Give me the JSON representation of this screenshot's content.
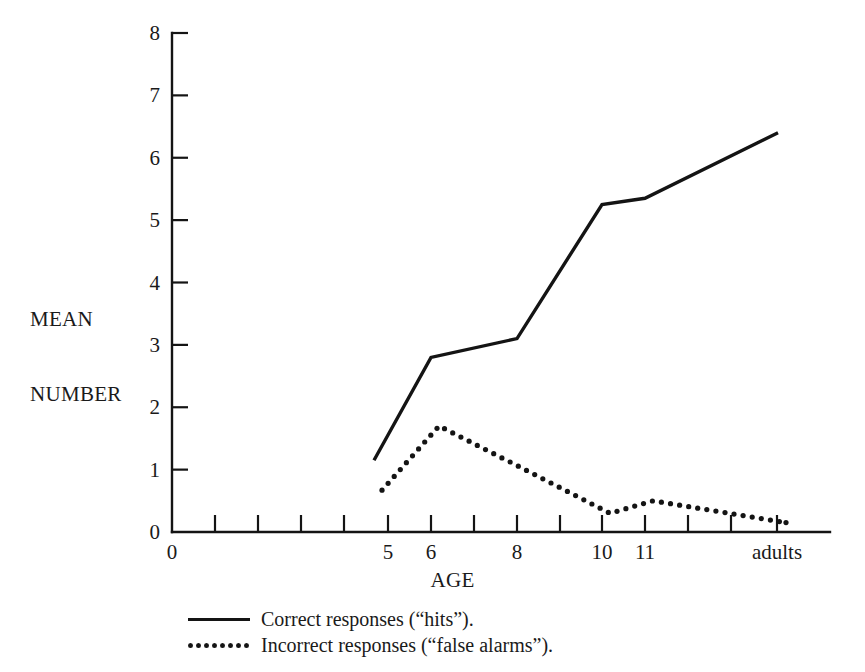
{
  "chart_data": {
    "type": "line",
    "title": "",
    "xlabel": "AGE",
    "ylabel": "MEAN\nNUMBER",
    "ylabel_lines": [
      "MEAN",
      "NUMBER"
    ],
    "ylim": [
      0,
      8
    ],
    "ytick_values": [
      0,
      1,
      2,
      3,
      4,
      5,
      6,
      7,
      8
    ],
    "ytick_labels": [
      "0",
      "1",
      "2",
      "3",
      "4",
      "5",
      "6",
      "7",
      "8"
    ],
    "grid": false,
    "legend_position": "below-axes",
    "x_axis": {
      "tick_count": 15,
      "tick_positions_px": [
        215,
        258,
        301,
        344,
        388,
        431,
        474,
        517,
        560,
        602,
        645,
        688,
        731,
        777
      ],
      "origin_label": "0",
      "labels": [
        {
          "text": "0",
          "x_px": 172
        },
        {
          "text": "5",
          "x_px": 388
        },
        {
          "text": "6",
          "x_px": 431
        },
        {
          "text": "8",
          "x_px": 517
        },
        {
          "text": "10",
          "x_px": 602
        },
        {
          "text": "11",
          "x_px": 645
        },
        {
          "text": "adults",
          "x_px": 777
        }
      ]
    },
    "categories": [
      "5",
      "6",
      "8",
      "10",
      "11",
      "adults"
    ],
    "category_x_px": [
      374,
      431,
      517,
      602,
      645,
      778
    ],
    "series": [
      {
        "name": "Correct responses (“hits”).",
        "style": "solid",
        "values": [
          1.15,
          2.8,
          3.1,
          5.25,
          5.35,
          6.4
        ]
      },
      {
        "name": "Incorrect responses (“false alarms”).",
        "style": "dotted",
        "values": [
          0.67,
          1.7,
          1.0,
          0.3,
          0.5,
          0.15
        ]
      }
    ]
  },
  "legend": {
    "items": [
      {
        "label": "Correct responses (“hits”).",
        "style": "solid"
      },
      {
        "label": "Incorrect responses (“false alarms”).",
        "style": "dotted"
      }
    ]
  },
  "colors": {
    "ink": "#141414",
    "background": "#ffffff"
  }
}
